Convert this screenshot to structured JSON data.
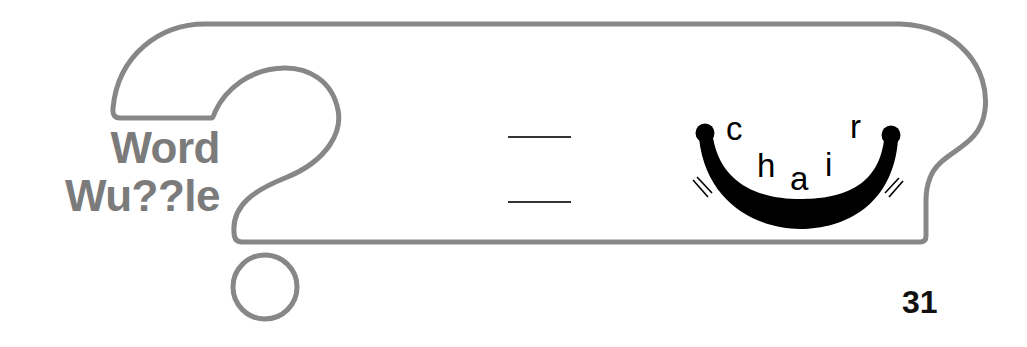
{
  "puzzle": {
    "title_line1": "Word",
    "title_line2": "Wu??le",
    "letters": [
      "c",
      "h",
      "a",
      "i",
      "r"
    ],
    "answer_blanks": 2,
    "page_number": "31"
  },
  "colors": {
    "outline": "#878787",
    "title": "#7b7b7b",
    "chair": "#000000"
  },
  "icons": {
    "frame": "question-mark-frame",
    "chair": "rocking-chair-curve"
  }
}
